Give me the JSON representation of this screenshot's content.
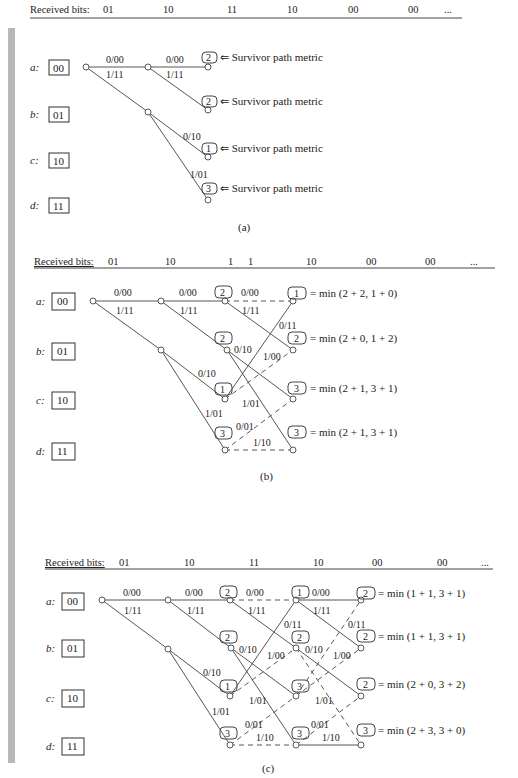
{
  "page": {
    "header_fragment": "CONVOLUTIONAL CODES"
  },
  "panels": [
    {
      "id": "a",
      "caption": "(a)",
      "received_bits_label": "Received bits:",
      "received_bits": [
        "01",
        "10",
        "11",
        "10",
        "00",
        "00",
        "..."
      ],
      "states": [
        {
          "name": "a:",
          "value": "00"
        },
        {
          "name": "b:",
          "value": "01"
        },
        {
          "name": "c:",
          "value": "10"
        },
        {
          "name": "d:",
          "value": "11"
        }
      ],
      "branch_labels": [
        "0/00",
        "1/11",
        "0/00",
        "1/11",
        "0/10",
        "1/01"
      ],
      "metrics": [
        {
          "value": "2",
          "note": "⇐ Survivor path metric"
        },
        {
          "value": "2",
          "note": "⇐ Survivor path metric"
        },
        {
          "value": "1",
          "note": "⇐ Survivor path metric"
        },
        {
          "value": "3",
          "note": "⇐ Survivor path metric"
        }
      ]
    },
    {
      "id": "b",
      "caption": "(b)",
      "received_bits_label": "Received bits:",
      "received_bits": [
        "01",
        "10",
        "1",
        "1",
        "10",
        "00",
        "00",
        "..."
      ],
      "states": [
        {
          "name": "a:",
          "value": "00"
        },
        {
          "name": "b:",
          "value": "01"
        },
        {
          "name": "c:",
          "value": "10"
        },
        {
          "name": "d:",
          "value": "11"
        }
      ],
      "branch_labels": [
        "0/00",
        "1/11",
        "0/00",
        "1/11",
        "0/10",
        "1/01",
        "0/00",
        "1/11",
        "0/11",
        "0/10",
        "1/00",
        "1/01",
        "0/01",
        "1/10"
      ],
      "intermediate_metrics": [
        "2",
        "2",
        "1",
        "3"
      ],
      "metrics": [
        {
          "value": "1",
          "note": "= min (2 + 2, 1 + 0)"
        },
        {
          "value": "2",
          "note": "= min (2 + 0, 1 + 2)"
        },
        {
          "value": "3",
          "note": "= min (2 + 1, 3 + 1)"
        },
        {
          "value": "3",
          "note": "= min (2 + 1, 3 + 1)"
        }
      ]
    },
    {
      "id": "c",
      "caption": "(c)",
      "received_bits_label": "Received bits:",
      "received_bits": [
        "01",
        "10",
        "11",
        "10",
        "00",
        "00",
        "..."
      ],
      "states": [
        {
          "name": "a:",
          "value": "00"
        },
        {
          "name": "b:",
          "value": "01"
        },
        {
          "name": "c:",
          "value": "10"
        },
        {
          "name": "d:",
          "value": "11"
        }
      ],
      "branch_labels": [
        "0/00",
        "1/11",
        "0/00",
        "1/11",
        "0/10",
        "1/01",
        "0/00",
        "1/11",
        "0/11",
        "0/10",
        "1/00",
        "1/01",
        "0/01",
        "1/10",
        "0/00",
        "1/11",
        "0/11",
        "0/10",
        "1/00",
        "1/01",
        "0/01",
        "1/10"
      ],
      "intermediate_metrics_t2": [
        "2",
        "2",
        "1",
        "3"
      ],
      "intermediate_metrics_t3": [
        "1",
        "2",
        "3",
        "3"
      ],
      "metrics": [
        {
          "value": "2",
          "note": "= min (1 + 1, 3 + 1)"
        },
        {
          "value": "2",
          "note": "= min (1 + 1, 3 + 1)"
        },
        {
          "value": "2",
          "note": "= min (2 + 0, 3 + 2)"
        },
        {
          "value": "3",
          "note": "= min (2 + 3, 3 + 0)"
        }
      ]
    }
  ]
}
